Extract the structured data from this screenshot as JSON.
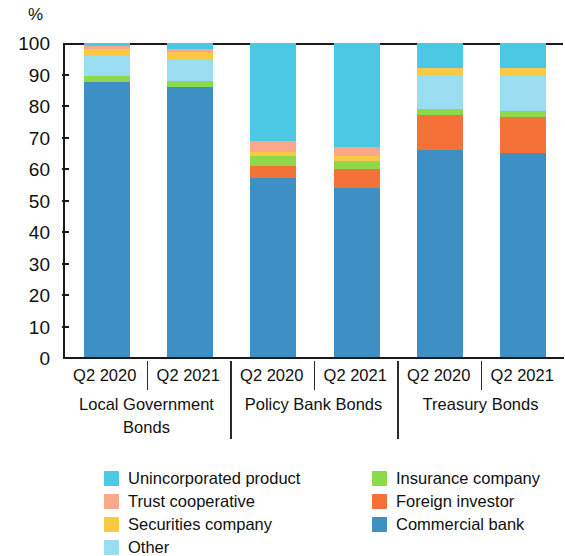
{
  "axis": {
    "y_unit_label": "%",
    "y_ticks": [
      "100",
      "90",
      "80",
      "70",
      "60",
      "50",
      "40",
      "30",
      "20",
      "10",
      "0"
    ]
  },
  "groups": [
    {
      "name": "Local Government Bonds",
      "periods": [
        "Q2 2020",
        "Q2 2021"
      ]
    },
    {
      "name": "Policy Bank Bonds",
      "periods": [
        "Q2 2020",
        "Q2 2021"
      ]
    },
    {
      "name": "Treasury Bonds",
      "periods": [
        "Q2 2020",
        "Q2 2021"
      ]
    }
  ],
  "legend": [
    {
      "label": "Unincorporated product",
      "color": "#4BC8E4"
    },
    {
      "label": "Insurance company",
      "color": "#8CD94A"
    },
    {
      "label": "Trust cooperative",
      "color": "#F9A98A"
    },
    {
      "label": "Foreign investor",
      "color": "#F47238"
    },
    {
      "label": "Securities company",
      "color": "#F9C945"
    },
    {
      "label": "Commercial bank",
      "color": "#3D8FC4"
    },
    {
      "label": "Other",
      "color": "#9BDDF0"
    }
  ],
  "chart_data": {
    "type": "bar",
    "stacked": true,
    "title": "",
    "xlabel": "",
    "ylabel": "%",
    "ylim": [
      0,
      100
    ],
    "yticks": [
      0,
      10,
      20,
      30,
      40,
      50,
      60,
      70,
      80,
      90,
      100
    ],
    "grid": false,
    "legend_position": "bottom",
    "categories": [
      "Local Government Bonds Q2 2020",
      "Local Government Bonds Q2 2021",
      "Policy Bank Bonds Q2 2020",
      "Policy Bank Bonds Q2 2021",
      "Treasury Bonds Q2 2020",
      "Treasury Bonds Q2 2021"
    ],
    "series": [
      {
        "name": "Commercial bank",
        "color": "#3D8FC4",
        "values": [
          87.5,
          86.0,
          57.0,
          54.0,
          66.0,
          65.0
        ]
      },
      {
        "name": "Foreign investor",
        "color": "#F47238",
        "values": [
          0.0,
          0.0,
          4.0,
          6.0,
          11.0,
          11.5
        ]
      },
      {
        "name": "Insurance company",
        "color": "#8CD94A",
        "values": [
          2.0,
          2.0,
          3.0,
          2.5,
          2.0,
          2.0
        ]
      },
      {
        "name": "Other",
        "color": "#9BDDF0",
        "values": [
          6.5,
          6.5,
          0.0,
          0.0,
          11.0,
          11.0
        ]
      },
      {
        "name": "Securities company",
        "color": "#F9C945",
        "values": [
          2.0,
          2.5,
          1.5,
          1.5,
          2.0,
          2.5
        ]
      },
      {
        "name": "Trust cooperative",
        "color": "#F9A98A",
        "values": [
          1.0,
          1.0,
          3.5,
          3.0,
          0.0,
          0.0
        ]
      },
      {
        "name": "Unincorporated product",
        "color": "#4BC8E4",
        "values": [
          1.0,
          2.0,
          31.0,
          33.0,
          8.0,
          8.0
        ]
      }
    ]
  }
}
